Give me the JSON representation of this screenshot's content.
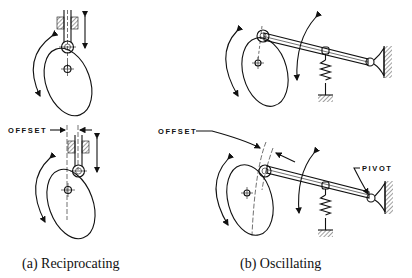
{
  "figure": {
    "panels": [
      {
        "id": "a",
        "caption": "(a) Reciprocating",
        "offset_label": "OFFSET",
        "follower_type": "reciprocating roller follower",
        "variants": [
          "centered",
          "offset"
        ]
      },
      {
        "id": "b",
        "caption": "(b) Oscillating",
        "offset_label": "OFFSET",
        "pivot_label": "PIVOT",
        "follower_type": "oscillating roller follower with spring",
        "variants": [
          "centered",
          "offset"
        ]
      }
    ],
    "colors": {
      "ink": "#111111",
      "background": "#ffffff"
    }
  }
}
